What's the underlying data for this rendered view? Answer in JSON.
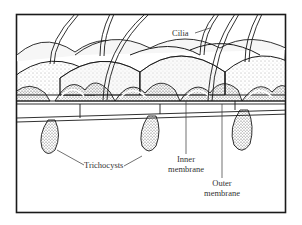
{
  "figure": {
    "labels": {
      "cilia": "Cilia",
      "trichocysts": "Trichocysts",
      "inner_membrane_1": "Inner",
      "inner_membrane_2": "membrane",
      "outer_membrane_1": "Outer",
      "outer_membrane_2": "membrane"
    },
    "colors": {
      "ink": "#1a1a1a",
      "paper": "#ffffff",
      "stipple": "#777777"
    }
  }
}
